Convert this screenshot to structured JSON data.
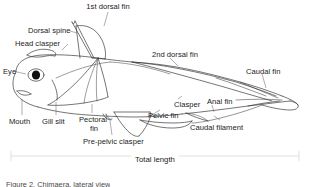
{
  "figure": {
    "type": "anatomical-line-diagram",
    "line_color": "#3a3a3a",
    "fill_color": "#ffffff",
    "text_color": "#1b1b1b",
    "leader_color": "#6d6d6d",
    "bracket_color": "#dcdcdc"
  },
  "labels": [
    {
      "id": "first-dorsal-fin",
      "text": "1st dorsal fin",
      "x": 108,
      "y": 3,
      "align": "center"
    },
    {
      "id": "dorsal-spine",
      "text": "Dorsal spine",
      "x": 28,
      "y": 27,
      "align": "left"
    },
    {
      "id": "head-clasper",
      "text": "Head clasper",
      "x": 15,
      "y": 40,
      "align": "left"
    },
    {
      "id": "eye",
      "text": "Eye",
      "x": 4,
      "y": 68,
      "align": "left"
    },
    {
      "id": "second-dorsal-fin",
      "text": "2nd dorsal fin",
      "x": 152,
      "y": 51,
      "align": "left"
    },
    {
      "id": "caudal-fin",
      "text": "Caudal fin",
      "x": 246,
      "y": 68,
      "align": "left"
    },
    {
      "id": "clasper",
      "text": "Clasper",
      "x": 174,
      "y": 101,
      "align": "left"
    },
    {
      "id": "anal-fin",
      "text": "Anal fin",
      "x": 207,
      "y": 98,
      "align": "left"
    },
    {
      "id": "pelvic-fin",
      "text": "Pelvic fin",
      "x": 148,
      "y": 112,
      "align": "left"
    },
    {
      "id": "mouth",
      "text": "Mouth",
      "x": 10,
      "y": 118,
      "align": "left"
    },
    {
      "id": "gill-slit",
      "text": "Gill slit",
      "x": 42,
      "y": 118,
      "align": "left"
    },
    {
      "id": "pectoral-fin-1",
      "text": "Pectoral",
      "x": 79,
      "y": 116,
      "align": "left"
    },
    {
      "id": "pectoral-fin-2",
      "text": "fin",
      "x": 90,
      "y": 125,
      "align": "left"
    },
    {
      "id": "caudal-filament",
      "text": "Caudal filament",
      "x": 190,
      "y": 124,
      "align": "left"
    },
    {
      "id": "pre-pelvic-clasper",
      "text": "Pre-pelvic clasper",
      "x": 83,
      "y": 138,
      "align": "left"
    }
  ],
  "measure": {
    "id": "total-length",
    "label": "Total length",
    "bracket_left": 11,
    "bracket_right": 299,
    "bracket_y": 156
  },
  "caption": {
    "text": "Figure 2. Chimaera, lateral view"
  }
}
